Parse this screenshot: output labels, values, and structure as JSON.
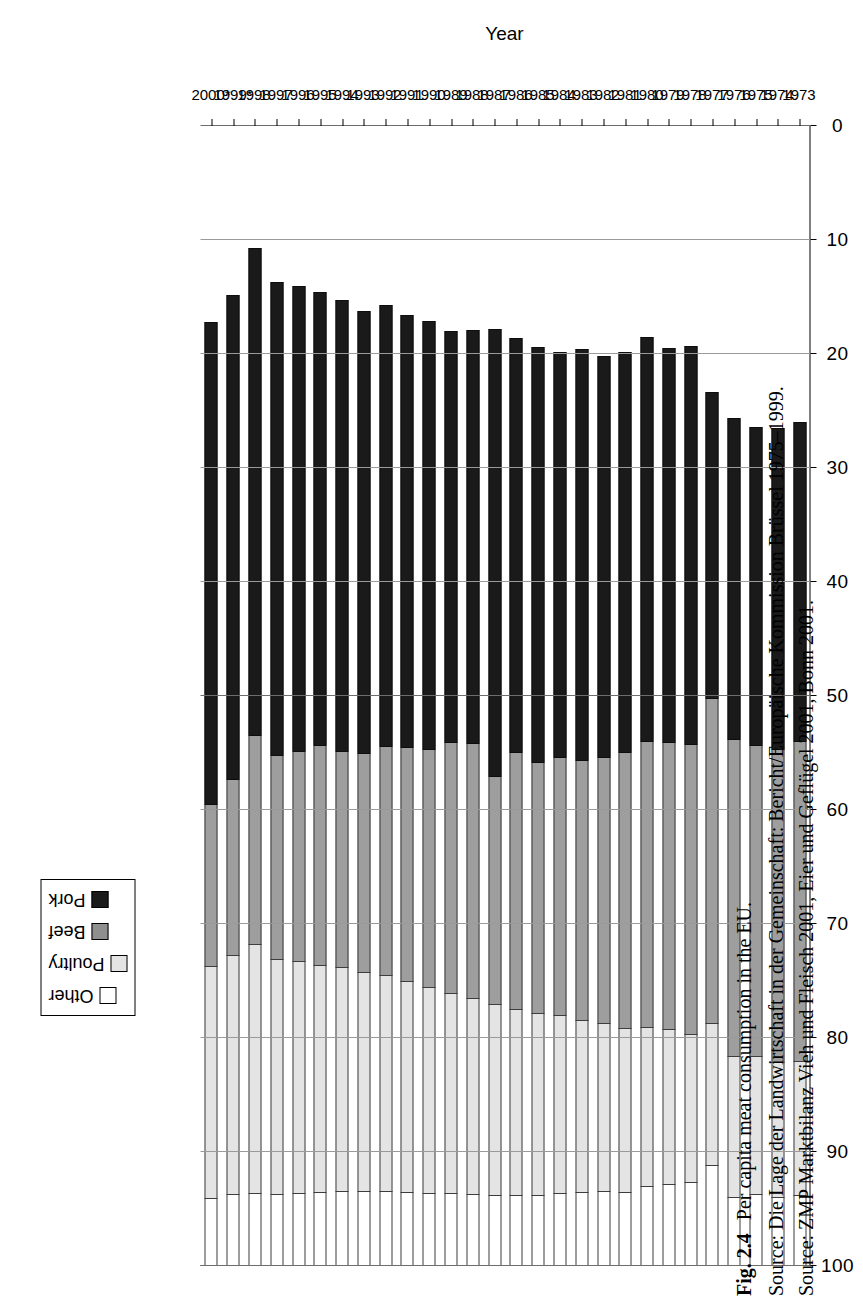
{
  "figure": {
    "label": "Fig. 2.4",
    "title": "Per capita meat consumption in the EU.",
    "source_line_1": "Source: Die Lage der Landwirtschaft in der Gemeinschaft: Bericht/Europäische Kommission Brüssel 1975–1999.",
    "source_line_2": "Source: ZMP Marktbilanz Vieh und Fleisch 2001, Eier und Geflügel 2001, Bonn 2001."
  },
  "legend": {
    "position": "top-left-rotated",
    "items": [
      {
        "label": "Other",
        "key": "other",
        "color": "#ffffff"
      },
      {
        "label": "Poultry",
        "key": "poultry",
        "color": "#e4e4e4"
      },
      {
        "label": "Beef",
        "key": "beef",
        "color": "#8f8f8f"
      },
      {
        "label": "Pork",
        "key": "pork",
        "color": "#1a1a1a"
      }
    ]
  },
  "chart_data": {
    "type": "bar",
    "orientation": "horizontal-stacked",
    "title": "Per capita meat consumption in the EU.",
    "xlabel": "Year",
    "ylabel": "",
    "ylim": [
      0,
      100
    ],
    "yticks": [
      0,
      10,
      20,
      30,
      40,
      50,
      60,
      70,
      80,
      90,
      100
    ],
    "ytick_labels": [
      "0",
      "10",
      "20",
      "30",
      "40",
      "50",
      "60",
      "70",
      "80",
      "90",
      "100"
    ],
    "grid": true,
    "legend_position": "top-left",
    "axis_reversed": true,
    "categories": [
      "1973",
      "1974",
      "1975",
      "1976",
      "1977",
      "1978",
      "1979",
      "1980",
      "1981",
      "1982",
      "1983",
      "1984",
      "1985",
      "1986",
      "1987",
      "1988",
      "1989",
      "1990",
      "1991",
      "1992",
      "1993",
      "1994",
      "1995",
      "1996",
      "1997",
      "1998",
      "1999*",
      "2000*"
    ],
    "series": [
      {
        "name": "Pork",
        "color": "#1a1a1a",
        "values": [
          28.0,
          28.2,
          28.0,
          28.3,
          27.0,
          35.0,
          34.6,
          35.5,
          35.2,
          35.2,
          36.1,
          35.6,
          36.5,
          36.4,
          39.3,
          36.3,
          36.1,
          37.6,
          38.0,
          38.8,
          38.9,
          39.6,
          39.8,
          40.9,
          41.6,
          42.8,
          42.6,
          42.4
        ]
      },
      {
        "name": "Beef",
        "color": "#8f8f8f",
        "values": [
          28.1,
          27.5,
          27.3,
          27.8,
          28.5,
          25.4,
          25.2,
          25.1,
          24.2,
          23.4,
          22.8,
          22.7,
          22.0,
          22.5,
          20.0,
          22.4,
          22.0,
          20.9,
          20.5,
          20.1,
          19.2,
          19.0,
          19.3,
          18.4,
          17.9,
          18.3,
          15.4,
          14.2
        ]
      },
      {
        "name": "Poultry",
        "color": "#e4e4e4",
        "values": [
          11.8,
          11.8,
          12.1,
          12.3,
          12.4,
          13.0,
          13.6,
          14.0,
          14.4,
          14.7,
          15.1,
          15.6,
          16.0,
          16.4,
          16.8,
          17.2,
          17.6,
          18.1,
          18.5,
          18.9,
          19.2,
          19.6,
          19.9,
          20.4,
          20.6,
          21.9,
          21.0,
          20.3
        ]
      },
      {
        "name": "Other",
        "color": "#ffffff",
        "values": [
          6.1,
          6.0,
          6.2,
          6.0,
          8.8,
          7.3,
          7.1,
          6.9,
          6.4,
          6.5,
          6.4,
          6.3,
          6.1,
          6.1,
          6.1,
          6.2,
          6.3,
          6.3,
          6.4,
          6.5,
          6.5,
          6.5,
          6.4,
          6.3,
          6.2,
          6.3,
          6.2,
          5.9
        ]
      }
    ],
    "totals": [
      74.0,
      73.5,
      73.6,
      74.4,
      76.7,
      80.7,
      80.5,
      81.5,
      80.2,
      79.8,
      80.4,
      80.2,
      80.6,
      81.4,
      82.2,
      82.1,
      82.0,
      82.9,
      83.4,
      84.3,
      83.8,
      84.7,
      85.4,
      86.0,
      86.3,
      89.3,
      85.2,
      82.8
    ]
  }
}
